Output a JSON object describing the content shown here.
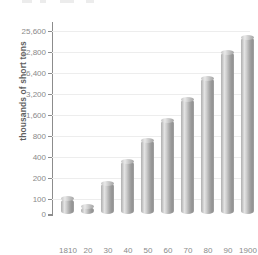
{
  "chart_data": {
    "type": "bar",
    "title": "",
    "subtitle": "",
    "xlabel": "",
    "ylabel": "thousands of short tons",
    "categories": [
      "1810",
      "20",
      "30",
      "40",
      "50",
      "60",
      "70",
      "80",
      "90",
      "1900"
    ],
    "values": [
      80,
      30,
      150,
      300,
      600,
      900,
      1800,
      3600,
      10000,
      15000
    ],
    "yscale": "log2",
    "ytick_labels": [
      "0",
      "100",
      "200",
      "400",
      "800",
      "1,600",
      "3,200",
      "6,400",
      "12,800",
      "25,600"
    ],
    "ytick_values": [
      0,
      100,
      200,
      400,
      800,
      1600,
      3200,
      6400,
      12800,
      25600
    ],
    "ylim": [
      0,
      25600
    ],
    "grid": true,
    "legend": "none",
    "series": [
      {
        "name": "coal production",
        "values": [
          80,
          30,
          150,
          300,
          600,
          900,
          1800,
          3600,
          10000,
          15000
        ]
      }
    ],
    "bar_style": "3d-cylinder",
    "bar_color": "#b4b4b4"
  },
  "axes": {
    "y": {
      "title": "thousands of short tons",
      "ticks": [
        {
          "label": "25,600",
          "value": 25600,
          "pos": 6.5
        },
        {
          "label": "12,800",
          "value": 12800,
          "pos": 27.5
        },
        {
          "label": "6,400",
          "value": 6400,
          "pos": 48.5
        },
        {
          "label": "3,200",
          "value": 3200,
          "pos": 69.5
        },
        {
          "label": "1,600",
          "value": 1600,
          "pos": 90.5
        },
        {
          "label": "800",
          "value": 800,
          "pos": 111.5
        },
        {
          "label": "400",
          "value": 400,
          "pos": 132.5
        },
        {
          "label": "200",
          "value": 200,
          "pos": 153.5
        },
        {
          "label": "100",
          "value": 100,
          "pos": 174.5
        },
        {
          "label": "0",
          "value": 0,
          "pos": 190
        }
      ]
    },
    "x": {
      "ticks": [
        {
          "label": "1810",
          "center": 16
        },
        {
          "label": "20",
          "center": 36
        },
        {
          "label": "30",
          "center": 56
        },
        {
          "label": "40",
          "center": 76
        },
        {
          "label": "50",
          "center": 96
        },
        {
          "label": "60",
          "center": 116
        },
        {
          "label": "70",
          "center": 136
        },
        {
          "label": "80",
          "center": 156
        },
        {
          "label": "90",
          "center": 176
        },
        {
          "label": "1900",
          "center": 196
        }
      ]
    }
  },
  "bars": [
    {
      "label": "1810",
      "value": 80,
      "left": 9,
      "height": 15.5
    },
    {
      "label": "20",
      "value": 30,
      "left": 29,
      "height": 7.5
    },
    {
      "label": "30",
      "value": 150,
      "left": 49,
      "height": 31
    },
    {
      "label": "40",
      "value": 300,
      "left": 69,
      "height": 53
    },
    {
      "label": "50",
      "value": 600,
      "left": 89,
      "height": 74
    },
    {
      "label": "60",
      "value": 900,
      "left": 109,
      "height": 94
    },
    {
      "label": "70",
      "value": 1800,
      "left": 129,
      "height": 115
    },
    {
      "label": "80",
      "value": 3600,
      "left": 149,
      "height": 136
    },
    {
      "label": "90",
      "value": 10000,
      "left": 169,
      "height": 162
    },
    {
      "label": "1900",
      "value": 15000,
      "left": 189,
      "height": 177
    }
  ]
}
